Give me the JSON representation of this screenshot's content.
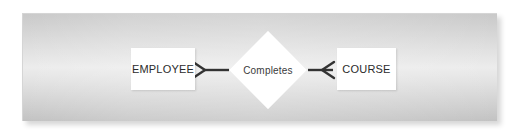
{
  "figure": {
    "type": "entity-relationship-diagram",
    "notation": "crows-foot",
    "background_color": "#e4e4e4",
    "shape_fill": "#ffffff",
    "line_color": "#333333"
  },
  "entities": [
    {
      "id": "employee",
      "label": "EMPLOYEE",
      "shape": "rectangle",
      "position": "left"
    },
    {
      "id": "course",
      "label": "COURSE",
      "shape": "rectangle",
      "position": "right"
    }
  ],
  "relationship": {
    "id": "completes",
    "label": "Completes",
    "shape": "diamond",
    "position": "center"
  },
  "connectors": [
    {
      "id": "employee-to-completes",
      "from": "employee",
      "to": "completes",
      "end_marker": "crows-foot",
      "marker_side": "from",
      "cardinality": "many"
    },
    {
      "id": "course-to-completes",
      "from": "course",
      "to": "completes",
      "end_marker": "crows-foot",
      "marker_side": "from",
      "cardinality": "many"
    }
  ]
}
